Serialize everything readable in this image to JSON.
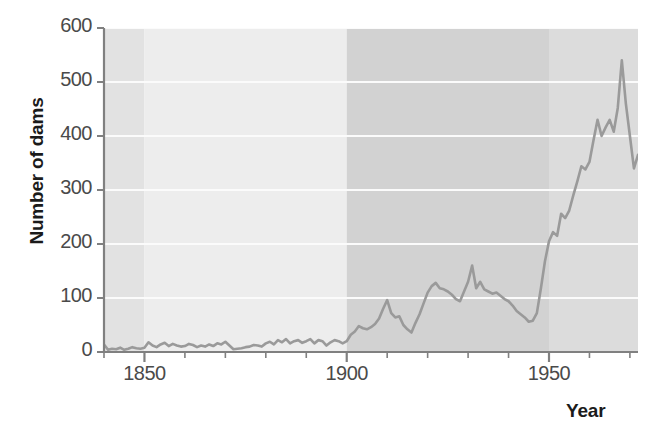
{
  "figure": {
    "title_remnant": "",
    "background_color": "#ffffff"
  },
  "axes": {
    "y_title": "Number of dams",
    "x_title": "Year",
    "y_ticks": [
      0,
      100,
      200,
      300,
      400,
      500,
      600
    ],
    "y_tick_labels": [
      "0",
      "100",
      "200",
      "300",
      "400",
      "500",
      "600"
    ],
    "x_major_ticks": [
      1850,
      1900,
      1950
    ],
    "x_major_tick_labels": [
      "1850",
      "1900",
      "1950"
    ],
    "x_minor_tick_step": 10,
    "axis_color": "#808080",
    "tick_label_color": "#4a4a4a",
    "title_color": "#1b1b1b"
  },
  "style": {
    "line_color": "#9a9a9a",
    "line_width": 2.6,
    "gridline_color": "#fbfbfb",
    "band_colors": [
      "#e2e2e2",
      "#ededed",
      "#d2d2d2",
      "#dcdcdc"
    ]
  },
  "chart_data": {
    "type": "line",
    "title": "",
    "xlabel": "Year",
    "ylabel": "Number of dams",
    "xlim": [
      1840,
      1972
    ],
    "ylim": [
      0,
      600
    ],
    "grid": true,
    "legend": "none",
    "bands": [
      {
        "x0": 1840,
        "x1": 1850,
        "color": "#e2e2e2"
      },
      {
        "x0": 1850,
        "x1": 1900,
        "color": "#ededed"
      },
      {
        "x0": 1900,
        "x1": 1950,
        "color": "#d2d2d2"
      },
      {
        "x0": 1950,
        "x1": 1972,
        "color": "#dcdcdc"
      }
    ],
    "x": [
      1840,
      1841,
      1842,
      1843,
      1844,
      1845,
      1846,
      1847,
      1848,
      1849,
      1850,
      1851,
      1852,
      1853,
      1854,
      1855,
      1856,
      1857,
      1858,
      1859,
      1860,
      1861,
      1862,
      1863,
      1864,
      1865,
      1866,
      1867,
      1868,
      1869,
      1870,
      1871,
      1872,
      1873,
      1874,
      1875,
      1876,
      1877,
      1878,
      1879,
      1880,
      1881,
      1882,
      1883,
      1884,
      1885,
      1886,
      1887,
      1888,
      1889,
      1890,
      1891,
      1892,
      1893,
      1894,
      1895,
      1896,
      1897,
      1898,
      1899,
      1900,
      1901,
      1902,
      1903,
      1904,
      1905,
      1906,
      1907,
      1908,
      1909,
      1910,
      1911,
      1912,
      1913,
      1914,
      1915,
      1916,
      1917,
      1918,
      1919,
      1920,
      1921,
      1922,
      1923,
      1924,
      1925,
      1926,
      1927,
      1928,
      1929,
      1930,
      1931,
      1932,
      1933,
      1934,
      1935,
      1936,
      1937,
      1938,
      1939,
      1940,
      1941,
      1942,
      1943,
      1944,
      1945,
      1946,
      1947,
      1948,
      1949,
      1950,
      1951,
      1952,
      1953,
      1954,
      1955,
      1956,
      1957,
      1958,
      1959,
      1960,
      1961,
      1962,
      1963,
      1964,
      1965,
      1966,
      1967,
      1968,
      1969,
      1970,
      1971,
      1972
    ],
    "values": [
      14,
      4,
      6,
      5,
      8,
      4,
      6,
      9,
      7,
      6,
      8,
      18,
      12,
      9,
      14,
      17,
      11,
      15,
      12,
      10,
      11,
      15,
      13,
      9,
      12,
      10,
      14,
      11,
      16,
      14,
      19,
      12,
      5,
      6,
      7,
      9,
      10,
      13,
      12,
      10,
      16,
      19,
      14,
      22,
      18,
      24,
      16,
      20,
      22,
      17,
      20,
      24,
      16,
      22,
      20,
      12,
      18,
      22,
      20,
      16,
      20,
      32,
      38,
      48,
      44,
      42,
      46,
      52,
      62,
      80,
      96,
      72,
      64,
      66,
      50,
      42,
      36,
      54,
      70,
      90,
      110,
      122,
      128,
      118,
      116,
      112,
      106,
      98,
      94,
      112,
      130,
      160,
      118,
      130,
      116,
      112,
      108,
      110,
      104,
      98,
      94,
      86,
      76,
      70,
      64,
      56,
      58,
      72,
      118,
      168,
      205,
      222,
      215,
      256,
      248,
      262,
      290,
      316,
      344,
      338,
      352,
      392,
      430,
      400,
      416,
      430,
      408,
      452,
      540,
      460,
      400,
      340,
      365
    ],
    "annotations": {
      "peak_value": 540,
      "peak_year": 1968,
      "final_value": 365,
      "final_year": 1972
    }
  }
}
